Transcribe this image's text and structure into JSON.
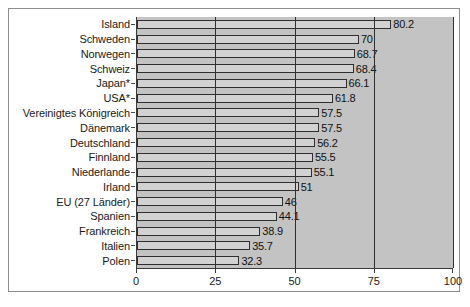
{
  "chart_data": {
    "type": "bar",
    "orientation": "horizontal",
    "title": "",
    "subtitle": "",
    "xlabel": "",
    "ylabel": "",
    "xlim": [
      0,
      100
    ],
    "xticks": [
      0,
      25,
      50,
      75,
      100
    ],
    "xtick_labels": [
      "0",
      "25",
      "50",
      "75",
      "100"
    ],
    "grid": true,
    "grid_axis": "x",
    "legend": false,
    "legend_position": "none",
    "categories": [
      "Island",
      "Schweden",
      "Norwegen",
      "Schweiz",
      "Japan*",
      "USA*",
      "Vereinigtes Königreich",
      "Dänemark",
      "Deutschland",
      "Finnland",
      "Niederlande",
      "Irland",
      "EU (27 Länder)",
      "Spanien",
      "Frankreich",
      "Italien",
      "Polen"
    ],
    "values": [
      80.2,
      70,
      68.7,
      68.4,
      66.1,
      61.8,
      57.5,
      57.5,
      56.2,
      55.5,
      55.1,
      51,
      46,
      44.1,
      38.9,
      35.7,
      32.3
    ],
    "value_labels": [
      "80.2",
      "70",
      "68.7",
      "68.4",
      "66.1",
      "61.8",
      "57.5",
      "57.5",
      "56.2",
      "55.5",
      "55.1",
      "51",
      "46",
      "44.1",
      "38.9",
      "35.7",
      "32.3"
    ],
    "colors": {
      "bar_fill": "#d2d2d2",
      "bar_border": "#2e2e2e",
      "plot_background": "#c3c3c3",
      "figure_background": "#ffffff",
      "axis": "#3a3a3a",
      "gridline": "#2f2f2f",
      "text": "#1a1a1a"
    }
  }
}
